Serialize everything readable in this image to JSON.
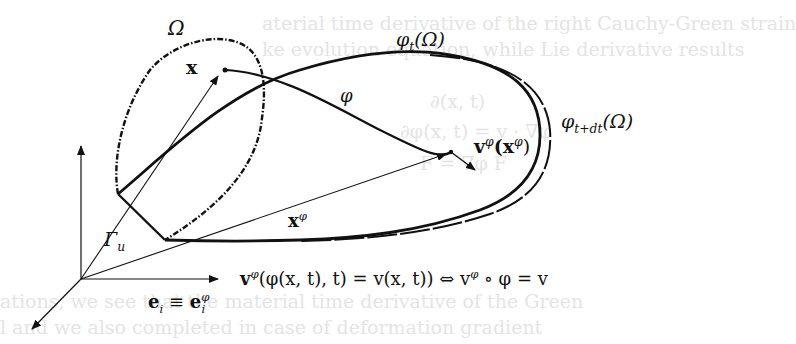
{
  "figure": {
    "type": "continuum-mechanics-deformation-diagram",
    "background_text": [
      {
        "text": "aterial time derivative of the right Cauchy-Green strain",
        "x": 262,
        "y": 12
      },
      {
        "text": "ke evolution equation, while Lie derivative results",
        "x": 262,
        "y": 36
      },
      {
        "text": "∂(x, t)",
        "x": 430,
        "y": 88
      },
      {
        "text": "∂φ(x, t) = v · ∇φ",
        "x": 400,
        "y": 118
      },
      {
        "text": "F = ∇φ F",
        "x": 420,
        "y": 150
      },
      {
        "text": "ations, we see that the material time derivative of the Green",
        "x": 0,
        "y": 288
      },
      {
        "text": "l and we also completed in case of deformation gradient",
        "x": 0,
        "y": 314
      }
    ],
    "labels": {
      "omega": "Ω",
      "x_vec": "x",
      "phi_t_omega_phi": "φ",
      "phi_t_omega_sub": "t",
      "phi_t_omega_arg": "(Ω)",
      "phi_tdt_omega_phi": "φ",
      "phi_tdt_omega_sub": "t+dt",
      "phi_tdt_omega_arg": "(Ω)",
      "phi_map": "φ",
      "v_phi_x_phi_v": "v",
      "v_phi_x_phi_sup": "φ",
      "v_phi_x_phi_open": "(x",
      "v_phi_x_phi_sup2": "φ",
      "v_phi_x_phi_close": ")",
      "x_phi_x": "x",
      "x_phi_sup": "φ",
      "gamma_u": "Γ",
      "gamma_u_sub": "u",
      "basis_e": "e",
      "basis_i": "i",
      "basis_equiv": " ≡ ",
      "basis_e2": "e",
      "basis_sup": "φ",
      "basis_sub": "i",
      "equation": "v^φ(φ(x, t), t) = v(x, t))  ⇔  v^φ ∘ φ = v",
      "eq_part1": "v",
      "eq_sup1": "φ",
      "eq_part2": "(φ(x, t), t) = v(x, t))  ⇔  v",
      "eq_sup2": "φ",
      "eq_part3": " ∘ φ = v"
    },
    "colors": {
      "ink": "#111111",
      "background_text": "#e4e4e4",
      "background": "#ffffff"
    }
  }
}
